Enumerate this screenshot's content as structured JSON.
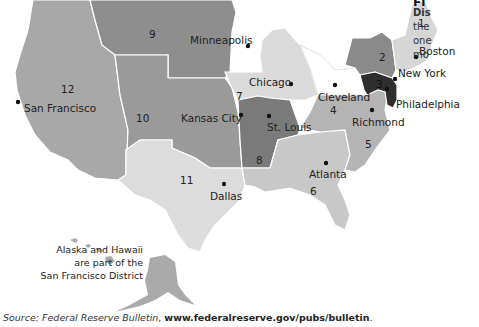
{
  "caption": {
    "title_fragment": "Fi",
    "subtitle_fragment": "Dis",
    "lines": [
      "the",
      "one",
      "mo"
    ]
  },
  "districts": [
    {
      "number": "1",
      "city": "Boston",
      "shade": "#d6d6d6"
    },
    {
      "number": "2",
      "city": "New York",
      "shade": "#8a8a8a"
    },
    {
      "number": "3",
      "city": "Philadelphia",
      "shade": "#2e2e2e"
    },
    {
      "number": "4",
      "city": "Cleveland",
      "shade": "#ffffff"
    },
    {
      "number": "5",
      "city": "Richmond",
      "shade": "#b4b4b4"
    },
    {
      "number": "6",
      "city": "Atlanta",
      "shade": "#c8c8c8"
    },
    {
      "number": "7",
      "city": "Chicago",
      "shade": "#dadada"
    },
    {
      "number": "8",
      "city": "St. Louis",
      "shade": "#7a7a7a"
    },
    {
      "number": "9",
      "city": "Minneapolis",
      "shade": "#8e8e8e"
    },
    {
      "number": "10",
      "city": "Kansas City",
      "shade": "#9a9a9a"
    },
    {
      "number": "11",
      "city": "Dallas",
      "shade": "#dcdcdc"
    },
    {
      "number": "12",
      "city": "San Francisco",
      "shade": "#a8a8a8"
    }
  ],
  "note": {
    "line1": "Alaska and Hawaii",
    "line2": "are part of the",
    "line3": "San Francisco District"
  },
  "source": {
    "prefix": "Source: ",
    "publication": "Federal Reserve Bulletin",
    "separator": ", ",
    "url": "www.federalreserve.gov/pubs/bulletin",
    "suffix": "."
  }
}
